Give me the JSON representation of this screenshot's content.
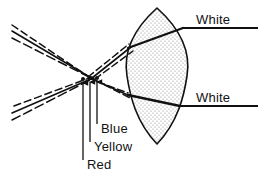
{
  "figure": {
    "type": "optical-ray-diagram",
    "background_color": "#ffffff",
    "ink_color": "#111111",
    "lens_fill_color": "#d8d8d8",
    "width": 261,
    "height": 182
  },
  "labels": {
    "white_top": "White",
    "white_bottom": "White",
    "blue": "Blue",
    "yellow": "Yellow",
    "red": "Red"
  },
  "lens": {
    "name": "biconvex-lens",
    "fill": "stippled",
    "top_tip_x": 157,
    "top_tip_y": 8,
    "bottom_tip_x": 157,
    "bottom_tip_y": 144,
    "left_edge_x": 128,
    "right_edge_x": 187,
    "mid_y": 76
  },
  "focal_points": [
    {
      "name": "blue-focus",
      "label": "Blue",
      "x": 97,
      "y": 78
    },
    {
      "name": "yellow-focus",
      "label": "Yellow",
      "x": 90,
      "y": 78
    },
    {
      "name": "red-focus",
      "label": "Red",
      "x": 83,
      "y": 79
    }
  ],
  "rays": {
    "incoming_upper_count": 3,
    "incoming_lower_count": 3,
    "style_solid": "white-composite-ray",
    "style_dashed": "dispersed-color-ray",
    "outgoing_top_label": "White",
    "outgoing_bottom_label": "White"
  },
  "leader_lines": [
    {
      "name": "leader-blue",
      "x": 97,
      "from_y": 80,
      "to_y": 124
    },
    {
      "name": "leader-yellow",
      "x": 90,
      "from_y": 80,
      "to_y": 142
    },
    {
      "name": "leader-red",
      "x": 83,
      "from_y": 81,
      "to_y": 160
    }
  ],
  "exit_lines": [
    {
      "name": "white-top-line",
      "x1": 182,
      "y1": 28,
      "x2": 258,
      "y2": 28
    },
    {
      "name": "white-bottom-line",
      "x1": 179,
      "y1": 106,
      "x2": 258,
      "y2": 106
    }
  ]
}
